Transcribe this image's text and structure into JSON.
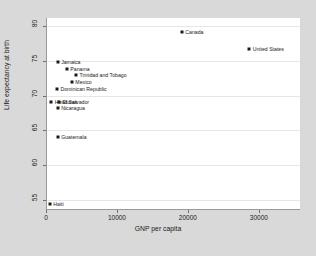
{
  "chart_data": {
    "type": "scatter",
    "title": "",
    "xlabel": "GNP per capita",
    "ylabel": "Life expectancy at birth",
    "xlim": [
      0,
      35800
    ],
    "ylim": [
      53.5,
      81.2
    ],
    "xticks": [
      0,
      10000,
      20000,
      30000
    ],
    "xtick_labels": [
      "0",
      "10000",
      "20000",
      "30000"
    ],
    "yticks": [
      55,
      60,
      65,
      70,
      75,
      80
    ],
    "ytick_labels": [
      "55",
      "60",
      "65",
      "70",
      "75",
      "80"
    ],
    "grid": "horizontal",
    "legend": "none",
    "marker_color": "#1a1a1a",
    "plot_bgcolor": "#ffffff",
    "figure_bgcolor": "#d9d9d9",
    "points": [
      {
        "label": "Canada",
        "x": 19000,
        "y": 79.2
      },
      {
        "label": "United States",
        "x": 28500,
        "y": 76.7
      },
      {
        "label": "Jamaica",
        "x": 1500,
        "y": 74.8
      },
      {
        "label": "Panama",
        "x": 2800,
        "y": 73.9
      },
      {
        "label": "Trinidad and Tobago",
        "x": 4100,
        "y": 73.0
      },
      {
        "label": "Mexico",
        "x": 3500,
        "y": 72.0
      },
      {
        "label": "Dominican Republic",
        "x": 1400,
        "y": 70.9
      },
      {
        "label": "Honduras",
        "x": 600,
        "y": 69.1
      },
      {
        "label": "El Salvador",
        "x": 1700,
        "y": 69.1
      },
      {
        "label": "Nicaragua",
        "x": 1500,
        "y": 68.2
      },
      {
        "label": "Guatemala",
        "x": 1500,
        "y": 64.0
      },
      {
        "label": "Haiti",
        "x": 400,
        "y": 54.3
      }
    ]
  },
  "axes": {
    "y_title": "Life expectancy at birth",
    "x_title": "GNP per capita"
  }
}
